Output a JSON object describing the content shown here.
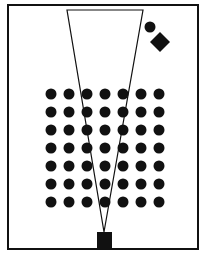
{
  "diagram": {
    "frame": {
      "x": 8,
      "y": 5,
      "width": 190,
      "height": 244
    },
    "field_of_view": {
      "top_left": [
        67,
        10
      ],
      "top_right": [
        143,
        10
      ],
      "apex": [
        104,
        232
      ]
    },
    "observer_square": {
      "x": 97,
      "y": 232,
      "width": 15,
      "height": 16
    },
    "dot_grid": {
      "rows": 7,
      "cols": 7,
      "start_x": 51,
      "start_y": 94,
      "step": 18,
      "radius": 5.5
    },
    "outlier_circle": {
      "cx": 150,
      "cy": 27,
      "r": 5.5
    },
    "outlier_diamond": {
      "cx": 160,
      "cy": 42,
      "half_diagonal": 10
    },
    "colors": {
      "ink": "#111111",
      "background": "#ffffff"
    }
  }
}
